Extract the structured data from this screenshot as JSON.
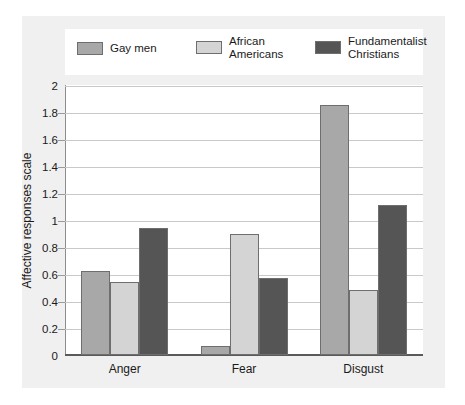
{
  "chart_data": {
    "type": "bar",
    "title": "",
    "xlabel": "",
    "ylabel": "Affective responses scale",
    "categories": [
      "Anger",
      "Fear",
      "Disgust"
    ],
    "series": [
      {
        "name": "Gay men",
        "color": "#a8a8a8",
        "values": [
          0.62,
          0.07,
          1.85
        ]
      },
      {
        "name": "African\nAmericans",
        "color": "#d4d4d4",
        "values": [
          0.54,
          0.9,
          0.48
        ]
      },
      {
        "name": "Fundamentalist\nChristians",
        "color": "#555555",
        "values": [
          0.94,
          0.57,
          1.11
        ]
      }
    ],
    "ylim": [
      0,
      2
    ],
    "yticks": [
      0,
      0.2,
      0.4,
      0.6,
      0.8,
      1,
      1.2,
      1.4,
      1.6,
      1.8,
      2
    ],
    "ytick_labels": [
      "0",
      "0.2",
      "0.4",
      "0.6",
      "0.8",
      "1",
      "1.2",
      "1.4",
      "1.6",
      "1.8",
      "2"
    ],
    "grid": true,
    "legend_position": "top"
  },
  "colors": {
    "canvas_background": "#f0f0f0",
    "plot_background": "#ffffff",
    "gridline": "#c9c9c9",
    "axis": "#5a5a5a",
    "bar_border": "#6e6e6e",
    "text": "#1a1a1a"
  }
}
